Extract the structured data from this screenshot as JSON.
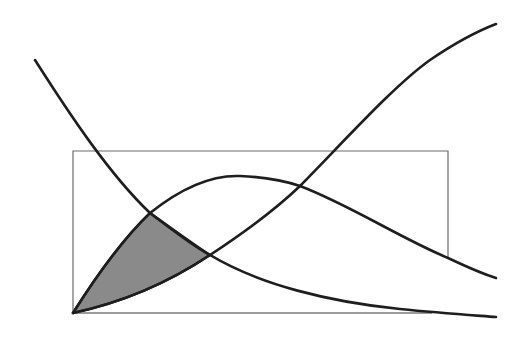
{
  "figure": {
    "type": "curve-diagram",
    "background": "#ffffff",
    "line_color": "#1e1e1e",
    "frame_color": "#6a6a6a",
    "shade_color": "#8a8a8a",
    "text": []
  },
  "elements": {
    "frame_rect": {
      "x": 73,
      "y": 151,
      "width": 375,
      "height": 162
    },
    "baseline": {
      "x1": 73,
      "y1": 313,
      "x2": 432,
      "y2": 313
    },
    "curves": [
      {
        "name": "decreasing-curve",
        "description": "monotonically decreasing curve from upper left to lower right"
      },
      {
        "name": "bell-curve",
        "description": "rises from origin to a peak then falls off to the right"
      },
      {
        "name": "s-curve",
        "description": "rises from origin, increasing to the upper right"
      }
    ],
    "intersections": [
      {
        "label": "decreasing-bell",
        "x": 150,
        "y": 213
      },
      {
        "label": "decreasing-s",
        "x": 210,
        "y": 255
      },
      {
        "label": "bell-s",
        "x": 300,
        "y": 186
      }
    ],
    "shaded_region": {
      "description": "region bounded by bell curve, decreasing curve and s-curve from origin",
      "vertices": [
        [
          73,
          313
        ],
        [
          150,
          213
        ],
        [
          210,
          255
        ]
      ]
    }
  }
}
